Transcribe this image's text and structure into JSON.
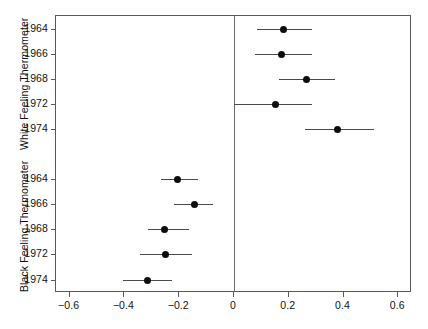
{
  "figure": {
    "width": 428,
    "height": 329,
    "background": "#ffffff",
    "point_color": "#0d0d0d",
    "line_color": "#4a4a4a",
    "frame_color": "#5a5a5a"
  },
  "axis": {
    "x_label": "",
    "x_ticks": [
      "-0.6",
      "-0.4",
      "-0.2",
      "0",
      "0.2",
      "0.4",
      "0.6"
    ],
    "x_tick_values": [
      -0.6,
      -0.4,
      -0.2,
      0,
      0.2,
      0.4,
      0.6
    ],
    "x_min": -0.65,
    "x_max": 0.65,
    "zero_reference": 0
  },
  "panels": [
    {
      "title": "White Feeling Thermometer",
      "categories": [
        "1964",
        "1966",
        "1968",
        "1972",
        "1974"
      ]
    },
    {
      "title": "Black Feeling Thermometer",
      "categories": [
        "1964",
        "1966",
        "1968",
        "1972",
        "1974"
      ]
    }
  ],
  "chart_data": {
    "type": "scatter",
    "title": "",
    "subtitle": "",
    "xlabel": "",
    "ylabel": "",
    "xlim": [
      -0.65,
      0.65
    ],
    "grid": false,
    "legend": null,
    "orientation": "horizontal",
    "style": "coefficient-plot-with-confidence-intervals",
    "x_ticks": [
      -0.6,
      -0.4,
      -0.2,
      0,
      0.2,
      0.4,
      0.6
    ],
    "x_tick_labels": [
      "-0.6",
      "-0.4",
      "-0.2",
      "0",
      "0.2",
      "0.4",
      "0.6"
    ],
    "reference_line_x": 0,
    "panels": [
      {
        "name": "White Feeling Thermometer",
        "categories": [
          "1964",
          "1966",
          "1968",
          "1972",
          "1974"
        ],
        "estimates": [
          0.18,
          0.175,
          0.265,
          0.15,
          0.377
        ],
        "ci_lower": [
          0.085,
          0.078,
          0.165,
          0.0,
          0.26
        ],
        "ci_upper": [
          0.285,
          0.285,
          0.37,
          0.285,
          0.51
        ]
      },
      {
        "name": "Black Feeling Thermometer",
        "categories": [
          "1964",
          "1966",
          "1968",
          "1972",
          "1974"
        ],
        "estimates": [
          -0.205,
          -0.145,
          -0.255,
          -0.25,
          -0.315
        ],
        "ci_lower": [
          -0.265,
          -0.22,
          -0.315,
          -0.345,
          -0.405
        ],
        "ci_upper": [
          -0.13,
          -0.075,
          -0.165,
          -0.155,
          -0.225
        ]
      }
    ]
  }
}
